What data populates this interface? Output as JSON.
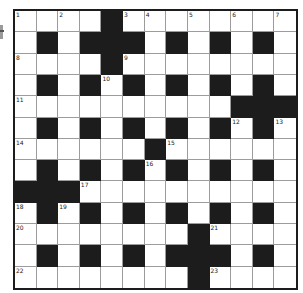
{
  "puzzle": {
    "type": "crossword",
    "rows": 13,
    "cols": 13,
    "colors": {
      "block": "#1c1c1c",
      "cell": "#ffffff",
      "gridline": "#9c9c9c"
    },
    "layout": [
      "....#........",
      ".#.###.#.#.#.",
      "....#........",
      ".#.#.#.#.#.#.",
      "..........###",
      ".#.#.#.#.#.#.",
      "......#......",
      ".#.#.#.#.#.#.",
      "###..........",
      ".#.#.#.#.#.#.",
      "........#....",
      ".#.#.#.###.#.",
      "........#...."
    ],
    "numbers": [
      {
        "r": 0,
        "c": 0,
        "n": "1"
      },
      {
        "r": 0,
        "c": 2,
        "n": "2"
      },
      {
        "r": 0,
        "c": 5,
        "n": "3"
      },
      {
        "r": 0,
        "c": 6,
        "n": "4"
      },
      {
        "r": 0,
        "c": 8,
        "n": "5"
      },
      {
        "r": 0,
        "c": 10,
        "n": "6"
      },
      {
        "r": 0,
        "c": 12,
        "n": "7"
      },
      {
        "r": 2,
        "c": 0,
        "n": "8"
      },
      {
        "r": 2,
        "c": 5,
        "n": "9"
      },
      {
        "r": 3,
        "c": 4,
        "n": "10"
      },
      {
        "r": 4,
        "c": 0,
        "n": "11"
      },
      {
        "r": 5,
        "c": 10,
        "n": "12"
      },
      {
        "r": 5,
        "c": 12,
        "n": "13"
      },
      {
        "r": 6,
        "c": 0,
        "n": "14"
      },
      {
        "r": 6,
        "c": 7,
        "n": "15"
      },
      {
        "r": 7,
        "c": 6,
        "n": "16"
      },
      {
        "r": 8,
        "c": 3,
        "n": "17"
      },
      {
        "r": 9,
        "c": 0,
        "n": "18"
      },
      {
        "r": 9,
        "c": 2,
        "n": "19"
      },
      {
        "r": 10,
        "c": 0,
        "n": "20"
      },
      {
        "r": 10,
        "c": 9,
        "n": "21"
      },
      {
        "r": 12,
        "c": 0,
        "n": "22"
      },
      {
        "r": 12,
        "c": 9,
        "n": "23"
      }
    ]
  }
}
